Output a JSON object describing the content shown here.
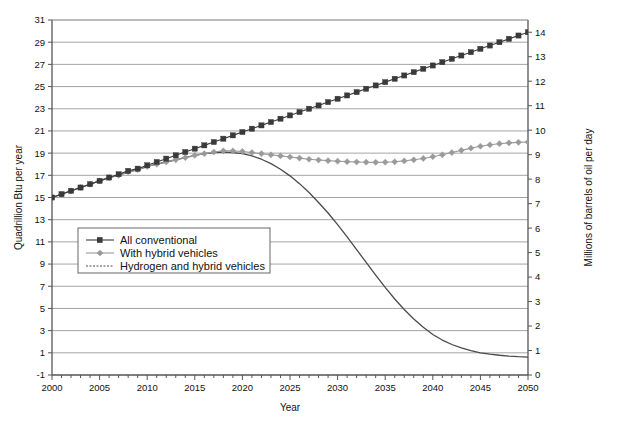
{
  "chart_data": {
    "type": "line",
    "title": "",
    "xlabel": "Year",
    "ylabel": "Quadrillion Btu per year",
    "y2label": "Millions of barrels of oil per day",
    "xlim": [
      2000,
      2050
    ],
    "ylim": [
      -1,
      31
    ],
    "y2lim": [
      0,
      14.5
    ],
    "xticks": [
      2000,
      2005,
      2010,
      2015,
      2020,
      2025,
      2030,
      2035,
      2040,
      2045,
      2050
    ],
    "xticklabels": [
      "2000",
      "2005",
      "2010",
      "2015",
      "2020",
      "2025",
      "2030",
      "2035",
      "2040",
      "2045",
      "2050"
    ],
    "x_minor_tick_step": 1,
    "yticks": [
      -1,
      1,
      3,
      5,
      7,
      9,
      11,
      13,
      15,
      17,
      19,
      21,
      23,
      25,
      27,
      29,
      31
    ],
    "yticklabels": [
      "-1",
      "1",
      "3",
      "5",
      "7",
      "9",
      "11",
      "13",
      "15",
      "17",
      "19",
      "21",
      "23",
      "25",
      "27",
      "29",
      "31"
    ],
    "y2ticks": [
      0,
      1,
      2,
      3,
      4,
      5,
      6,
      7,
      8,
      9,
      10,
      11,
      12,
      13,
      14
    ],
    "y2ticklabels": [
      "0",
      "1",
      "2",
      "3",
      "4",
      "5",
      "6",
      "7",
      "8",
      "9",
      "10",
      "11",
      "12",
      "13",
      "14"
    ],
    "grid": true,
    "grid_style": "solid gridlines on odd values, dotted gridlines on even values",
    "legend_position": "center-left inside plot",
    "x": [
      2000,
      2001,
      2002,
      2003,
      2004,
      2005,
      2006,
      2007,
      2008,
      2009,
      2010,
      2011,
      2012,
      2013,
      2014,
      2015,
      2016,
      2017,
      2018,
      2019,
      2020,
      2021,
      2022,
      2023,
      2024,
      2025,
      2026,
      2027,
      2028,
      2029,
      2030,
      2031,
      2032,
      2033,
      2034,
      2035,
      2036,
      2037,
      2038,
      2039,
      2040,
      2041,
      2042,
      2043,
      2044,
      2045,
      2046,
      2047,
      2048,
      2049,
      2050
    ],
    "series": [
      {
        "name": "All conventional",
        "marker": "square",
        "color": "#3a3a3a",
        "values": [
          15.0,
          15.3,
          15.6,
          15.9,
          16.2,
          16.5,
          16.8,
          17.1,
          17.4,
          17.6,
          17.9,
          18.2,
          18.5,
          18.8,
          19.1,
          19.4,
          19.7,
          20.0,
          20.3,
          20.6,
          20.9,
          21.2,
          21.5,
          21.8,
          22.1,
          22.4,
          22.7,
          23.0,
          23.3,
          23.6,
          23.9,
          24.2,
          24.5,
          24.8,
          25.1,
          25.4,
          25.7,
          26.0,
          26.3,
          26.6,
          26.9,
          27.2,
          27.5,
          27.8,
          28.1,
          28.4,
          28.7,
          29.0,
          29.3,
          29.6,
          29.9
        ]
      },
      {
        "name": "With hybrid vehicles",
        "marker": "diamond",
        "color": "#9a9a9a",
        "values": [
          15.0,
          15.3,
          15.6,
          15.9,
          16.2,
          16.5,
          16.8,
          17.0,
          17.3,
          17.5,
          17.8,
          18.0,
          18.2,
          18.4,
          18.6,
          18.8,
          18.95,
          19.1,
          19.2,
          19.2,
          19.15,
          19.05,
          18.95,
          18.85,
          18.75,
          18.65,
          18.55,
          18.45,
          18.38,
          18.32,
          18.27,
          18.23,
          18.2,
          18.18,
          18.17,
          18.18,
          18.22,
          18.3,
          18.4,
          18.52,
          18.68,
          18.85,
          19.05,
          19.25,
          19.45,
          19.62,
          19.75,
          19.85,
          19.92,
          19.97,
          20.0
        ]
      },
      {
        "name": "Hydrogen and hybrid vehicles",
        "marker": "none",
        "color": "#4a4a4a",
        "values": [
          15.0,
          15.3,
          15.6,
          15.9,
          16.2,
          16.5,
          16.8,
          17.0,
          17.3,
          17.5,
          17.8,
          18.0,
          18.2,
          18.4,
          18.6,
          18.8,
          18.95,
          19.05,
          19.1,
          19.05,
          18.95,
          18.75,
          18.45,
          18.05,
          17.55,
          16.95,
          16.25,
          15.45,
          14.55,
          13.6,
          12.55,
          11.45,
          10.3,
          9.15,
          8.0,
          6.9,
          5.85,
          4.9,
          4.05,
          3.3,
          2.65,
          2.15,
          1.75,
          1.45,
          1.2,
          1.0,
          0.88,
          0.78,
          0.7,
          0.65,
          0.62
        ]
      }
    ]
  },
  "legend": {
    "items": [
      {
        "label": "All conventional"
      },
      {
        "label": "With hybrid vehicles"
      },
      {
        "label": "Hydrogen and hybrid vehicles"
      }
    ]
  }
}
